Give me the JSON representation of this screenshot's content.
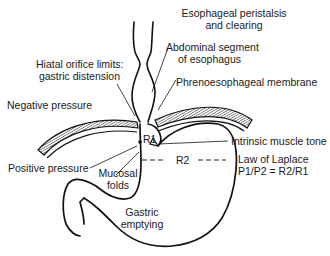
{
  "diagram": {
    "type": "anatomical-schematic",
    "colors": {
      "line": "#111111",
      "hatch": "#222222",
      "background": "#ffffff"
    },
    "labels": {
      "peristalsis_line1": "Esophageal peristalsis",
      "peristalsis_line2": "and clearing",
      "hiatal_line1": "Hiatal orifice limits:",
      "hiatal_line2": "gastric distension",
      "abdominal_line1": "Abdominal segment",
      "abdominal_line2": "of esophagus",
      "phrenoesophageal": "Phrenoesophageal membrane",
      "negative_pressure": "Negative pressure",
      "positive_pressure": "Positive pressure",
      "r1": "R1",
      "r2": "R2",
      "intrinsic": "Intrinsic muscle tone",
      "laplace_line1": "Law of Laplace",
      "laplace_line2": "P1/P2 = R2/R1",
      "mucosal_line1": "Mucosal",
      "mucosal_line2": "folds",
      "gastric_line1": "Gastric",
      "gastric_line2": "emptying"
    }
  }
}
